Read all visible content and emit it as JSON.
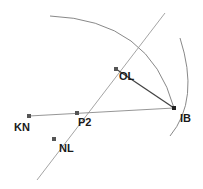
{
  "diagram": {
    "points": [
      {
        "id": "KN",
        "label": "KN"
      },
      {
        "id": "P2",
        "label": "P2"
      },
      {
        "id": "IB",
        "label": "IB"
      },
      {
        "id": "OL",
        "label": "OL"
      },
      {
        "id": "NL",
        "label": "NL"
      }
    ],
    "colors": {
      "line": "#9a9a9a",
      "segment": "#444444",
      "arc": "#7a7a7a",
      "point": "#555555",
      "label": "#1a1a1a"
    }
  }
}
